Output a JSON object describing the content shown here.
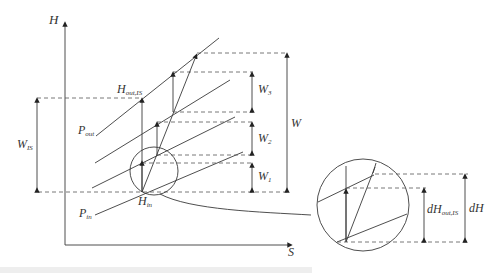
{
  "diagram": {
    "axes": {
      "y_label": "H",
      "x_label": "S"
    },
    "labels": {
      "h_out_is": "H",
      "h_out_is_sub": "out,IS",
      "p_out": "P",
      "p_out_sub": "out",
      "p_in": "P",
      "p_in_sub": "in",
      "h_in": "H",
      "h_in_sub": "in",
      "w_is": "W",
      "w_is_sub": "IS",
      "w": "W",
      "w1": "W",
      "w1_sub": "1",
      "w2": "W",
      "w2_sub": "2",
      "w3": "W",
      "w3_sub": "3",
      "dh_out_is": "dH",
      "dh_out_is_sub": "out,IS",
      "dh": "dH"
    },
    "colors": {
      "line": "#3a3a3a",
      "dash": "#555555",
      "background": "#ffffff"
    }
  }
}
